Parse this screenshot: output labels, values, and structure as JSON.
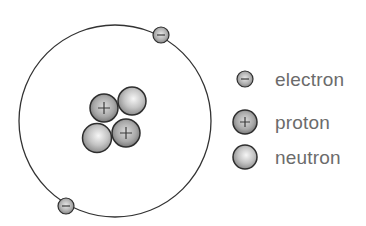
{
  "atom": {
    "orbit": {
      "cx": 115,
      "cy": 121,
      "r": 96
    },
    "electrons": [
      {
        "label": "electron",
        "sign": "−",
        "cx": 161,
        "cy": 35
      },
      {
        "label": "electron",
        "sign": "−",
        "cx": 66,
        "cy": 206
      }
    ],
    "nucleus": [
      {
        "type": "neutron",
        "cx": 132,
        "cy": 101
      },
      {
        "type": "neutron",
        "cx": 97,
        "cy": 138
      },
      {
        "type": "proton",
        "sign": "+",
        "cx": 104,
        "cy": 108
      },
      {
        "type": "proton",
        "sign": "+",
        "cx": 126,
        "cy": 133
      }
    ]
  },
  "legend": {
    "items": [
      {
        "label": "electron",
        "sign": "−"
      },
      {
        "label": "proton",
        "sign": "+"
      },
      {
        "label": "neutron",
        "sign": ""
      }
    ]
  },
  "colors": {
    "particle_outline": "#2e2e2e",
    "particle_fill_light": "#f4f4f4",
    "particle_fill_dark": "#8a8a8a",
    "orbit": "#333333",
    "legend_text": "#6b6b6b"
  }
}
